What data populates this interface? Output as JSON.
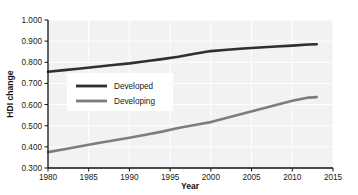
{
  "chart_data": {
    "type": "line",
    "title": "",
    "xlabel": "Year",
    "ylabel": "HDI change",
    "xlim": [
      1980,
      2015
    ],
    "ylim": [
      0.3,
      1.0
    ],
    "grid": true,
    "legend_position": "center-left inside plot",
    "xticks": [
      "1980",
      "1985",
      "1990",
      "1995",
      "2000",
      "2005",
      "2010",
      "2015"
    ],
    "xtick_values": [
      1980,
      1985,
      1990,
      1995,
      2000,
      2005,
      2010,
      2015
    ],
    "yticks": [
      "0.300",
      "0.400",
      "0.500",
      "0.600",
      "0.700",
      "0.800",
      "0.900",
      "1.000"
    ],
    "ytick_values": [
      0.3,
      0.4,
      0.5,
      0.6,
      0.7,
      0.8,
      0.9,
      1.0
    ],
    "x": [
      1980,
      1982,
      1984,
      1986,
      1988,
      1990,
      1992,
      1994,
      1996,
      1998,
      2000,
      2002,
      2004,
      2006,
      2008,
      2010,
      2012,
      2013
    ],
    "series": [
      {
        "name": "Developed",
        "color": "#2f2f2f",
        "values": [
          0.755,
          0.763,
          0.771,
          0.779,
          0.787,
          0.795,
          0.805,
          0.815,
          0.826,
          0.84,
          0.853,
          0.859,
          0.865,
          0.87,
          0.875,
          0.879,
          0.884,
          0.885
        ]
      },
      {
        "name": "Developing",
        "color": "#7d7d7d",
        "values": [
          0.375,
          0.389,
          0.403,
          0.417,
          0.43,
          0.443,
          0.457,
          0.472,
          0.489,
          0.503,
          0.517,
          0.538,
          0.558,
          0.578,
          0.598,
          0.618,
          0.633,
          0.635
        ]
      }
    ]
  },
  "style": {
    "plot_background": "#f2f2f2",
    "grid_color": "#ffffff",
    "axis_color": "#111111",
    "legend_background": "#ffffff"
  }
}
